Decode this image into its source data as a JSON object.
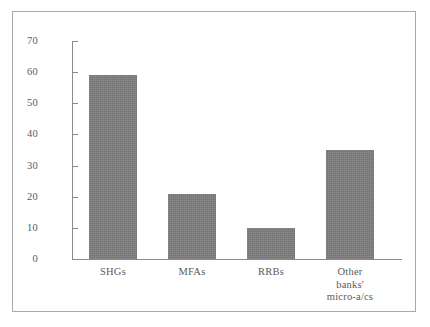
{
  "chart_data": {
    "type": "bar",
    "title": "",
    "subtitle": "",
    "xlabel": "",
    "ylabel": "",
    "categories": [
      "SHGs",
      "MFAs",
      "RRBs",
      "Other banks' micro-a/cs"
    ],
    "category_lines": [
      [
        "SHGs"
      ],
      [
        "MFAs"
      ],
      [
        "RRBs"
      ],
      [
        "Other",
        "banks'",
        "micro-a/cs"
      ]
    ],
    "values": [
      59,
      21,
      10,
      35
    ],
    "ylim": [
      0,
      70
    ],
    "yticks": [
      0,
      10,
      20,
      30,
      40,
      50,
      60,
      70
    ],
    "ytick_labels": [
      "0",
      "10",
      "20",
      "30",
      "40",
      "50",
      "60",
      "70"
    ],
    "grid": false,
    "legend": null,
    "legend_position": "none",
    "annotations": [],
    "bar_color": "#7c7c7c",
    "axis_color": "#8a8a8a",
    "text_color": "#5a5a5a",
    "frame_color": "#a8a8a8",
    "background_color": "#ffffff"
  }
}
